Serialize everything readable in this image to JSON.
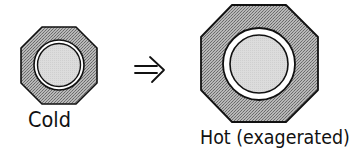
{
  "diagram": {
    "cold": {
      "label": "Cold",
      "shape": "octagon",
      "fill_pattern": "stippled-gray",
      "ring_color": "#ffffff",
      "core_color": "#d9d9d9"
    },
    "arrow": {
      "symbol": "=>",
      "meaning": "becomes"
    },
    "hot": {
      "label": "Hot (exagerated)",
      "shape": "octagon",
      "fill_pattern": "stippled-gray",
      "ring_color": "#ffffff",
      "core_color": "#d9d9d9"
    },
    "colors": {
      "outline": "#111111",
      "stipple_light": "#bdbdbd",
      "stipple_dark": "#6e6e6e"
    }
  }
}
